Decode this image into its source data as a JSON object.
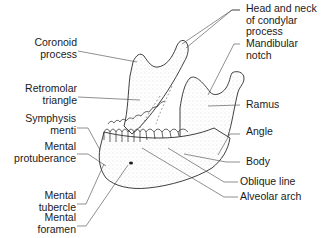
{
  "diagram": {
    "colors": {
      "line": "#2a2a2a",
      "leader": "#444444",
      "shade": "#d8d8d8",
      "background": "#ffffff"
    },
    "labels_left": [
      {
        "id": "coronoid-process",
        "lines": [
          "Coronoid",
          "process"
        ]
      },
      {
        "id": "retromolar-triangle",
        "lines": [
          "Retromolar",
          "triangle"
        ]
      },
      {
        "id": "symphysis-menti",
        "lines": [
          "Symphysis",
          "menti"
        ]
      },
      {
        "id": "mental-protuberance",
        "lines": [
          "Mental",
          "protuberance"
        ]
      },
      {
        "id": "mental-tubercle",
        "lines": [
          "Mental",
          "tubercle"
        ]
      },
      {
        "id": "mental-foramen",
        "lines": [
          "Mental",
          "foramen"
        ]
      }
    ],
    "labels_right": [
      {
        "id": "head-neck-condylar",
        "lines": [
          "Head and neck",
          "of condylar",
          "process"
        ]
      },
      {
        "id": "mandibular-notch",
        "lines": [
          "Mandibular",
          "notch"
        ]
      },
      {
        "id": "ramus",
        "lines": [
          "Ramus"
        ]
      },
      {
        "id": "angle",
        "lines": [
          "Angle"
        ]
      },
      {
        "id": "body",
        "lines": [
          "Body"
        ]
      },
      {
        "id": "oblique-line",
        "lines": [
          "Oblique line"
        ]
      },
      {
        "id": "alveolar-arch",
        "lines": [
          "Alveolar arch"
        ]
      }
    ]
  }
}
